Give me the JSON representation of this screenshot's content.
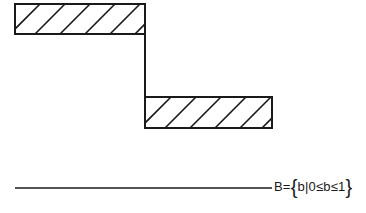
{
  "diagram": {
    "type": "step-function-hatched",
    "top_block": {
      "x": 15,
      "y": 4,
      "width": 130,
      "height": 30,
      "fill": "diagonal-hatch"
    },
    "connector": {
      "x": 145,
      "y1": 34,
      "y2": 97
    },
    "bottom_block": {
      "x": 145,
      "y": 97,
      "width": 127,
      "height": 31,
      "fill": "diagonal-hatch"
    },
    "baseline": {
      "x1": 15,
      "x2": 272,
      "y": 188
    },
    "set_label": {
      "prefix": "B=",
      "open_brace": "{",
      "body": "b|0≤b≤1",
      "close_brace": "}"
    },
    "stroke_color": "#1a1a1a"
  }
}
